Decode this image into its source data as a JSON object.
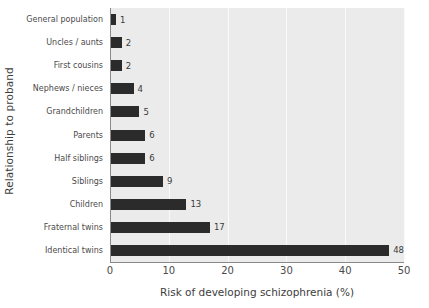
{
  "chart_data": {
    "type": "bar",
    "orientation": "horizontal",
    "title": "",
    "xlabel": "Risk of developing schizophrenia (%)",
    "ylabel": "Relationship to proband",
    "categories": [
      "General population",
      "Uncles / aunts",
      "First cousins",
      "Nephews / nieces",
      "Grandchildren",
      "Parents",
      "Half siblings",
      "Siblings",
      "Children",
      "Fraternal twins",
      "Identical twins"
    ],
    "values": [
      1,
      2,
      2,
      4,
      5,
      6,
      6,
      9,
      13,
      17,
      48
    ],
    "value_labels": [
      "1",
      "2",
      "2",
      "4",
      "5",
      "6",
      "6",
      "9",
      "13",
      "17",
      "48"
    ],
    "xlim": [
      0,
      50
    ],
    "xticks": [
      0,
      10,
      20,
      30,
      40,
      50
    ],
    "xtick_labels": [
      "0",
      "10",
      "20",
      "30",
      "40",
      "50"
    ],
    "grid": true,
    "grid_axis": "x",
    "legend": false,
    "bar_color": "#2b2b2b",
    "plot_background": "#ebebeb",
    "gridline_color": "#fafafa",
    "figure_background": "#ffffff"
  }
}
